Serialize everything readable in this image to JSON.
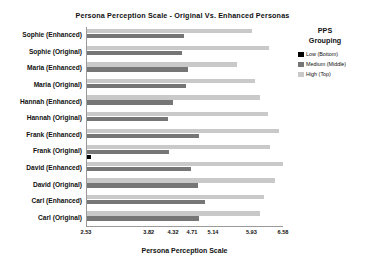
{
  "chart_data": {
    "type": "bar",
    "orientation": "horizontal",
    "title": "Persona Perception Scale - Original Vs. Enhanced Personas",
    "xlabel": "Persona Perception Scale",
    "ylabel": "",
    "grid": false,
    "legend_position": "right",
    "legend_title": "PPS Grouping",
    "xlim": [
      2.53,
      6.58
    ],
    "xticks": [
      "2.53",
      "3.82",
      "4.32",
      "4.71",
      "5.14",
      "5.93",
      "6.58"
    ],
    "xtick_values": [
      2.53,
      3.82,
      4.32,
      4.71,
      5.14,
      5.93,
      6.58
    ],
    "categories": [
      "Sophie (Enhanced)",
      "Sophie (Original)",
      "Maria (Enhanced)",
      "Maria (Original)",
      "Hannah (Enhanced)",
      "Hannah (Original)",
      "Frank (Enhanced)",
      "Frank (Original)",
      "David (Enhanced)",
      "David (Original)",
      "Carl (Enhanced)",
      "Carl (Original)"
    ],
    "series": [
      {
        "name": "Low (Bottom)",
        "color": "#000000",
        "values": [
          0,
          0,
          0,
          0,
          0,
          0,
          0,
          2.62,
          0,
          0,
          0,
          0
        ]
      },
      {
        "name": "Medium (Middle)",
        "color": "#767676",
        "values": [
          4.52,
          4.49,
          4.6,
          4.56,
          4.3,
          4.19,
          4.83,
          4.21,
          4.66,
          4.81,
          4.96,
          4.84
        ]
      },
      {
        "name": "High (Top)",
        "color": "#c9c9c9",
        "values": [
          5.93,
          6.28,
          5.62,
          5.99,
          6.08,
          6.26,
          6.47,
          6.29,
          6.55,
          6.4,
          6.17,
          6.09
        ]
      }
    ]
  },
  "legend": {
    "title_line1": "PPS",
    "title_line2": "Grouping",
    "items": [
      {
        "label": "Low (Bottom)",
        "color": "#000000"
      },
      {
        "label": "Medium (Middle)",
        "color": "#767676"
      },
      {
        "label": "High (Top)",
        "color": "#c9c9c9"
      }
    ]
  }
}
